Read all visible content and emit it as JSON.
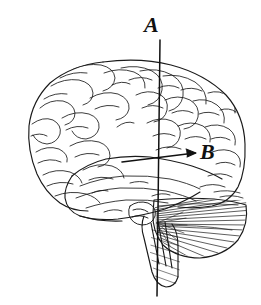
{
  "figure": {
    "type": "anatomical-line-drawing",
    "background_color": "#ffffff",
    "ink_color": "#1a1a1a",
    "width": 261,
    "height": 305
  },
  "labels": {
    "a": {
      "text": "A",
      "marker": "vertical-line",
      "description": "vertical line through brain",
      "x": 144,
      "y": 14
    },
    "b": {
      "text": "B",
      "marker": "horizontal-arrow",
      "description": "horizontal arrow pointing right",
      "x": 200,
      "y": 141
    }
  },
  "annotations": {
    "line_a": {
      "name": "vertical-reference-line",
      "x1": 160,
      "y1": 40,
      "x2": 157,
      "y2": 296
    },
    "arrow_b": {
      "name": "horizontal-pointer-arrow",
      "x1": 122,
      "y1": 162,
      "x2": 197,
      "y2": 153
    }
  },
  "regions": [
    {
      "name": "frontal-lobe"
    },
    {
      "name": "parietal-lobe"
    },
    {
      "name": "temporal-lobe"
    },
    {
      "name": "occipital-lobe"
    },
    {
      "name": "cerebellum"
    },
    {
      "name": "brainstem"
    }
  ]
}
